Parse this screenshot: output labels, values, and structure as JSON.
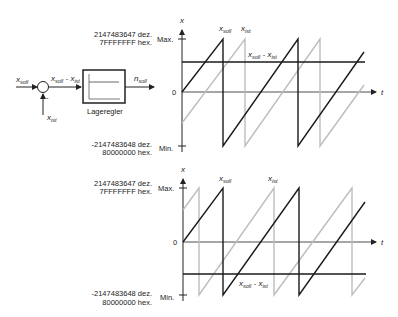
{
  "block_diagram": {
    "input_label": "x",
    "input_sub": "soll",
    "feedback_label": "x",
    "feedback_sub": "ist",
    "minus_sign": "-",
    "error_label_a": "x",
    "error_sub_a": "soll",
    "error_minus": " - ",
    "error_label_b": "x",
    "error_sub_b": "ist",
    "controller_label": "Lageregler",
    "output_label": "n",
    "output_sub": "soll"
  },
  "charts": [
    {
      "id": "top",
      "y_axis_label": "x",
      "x_axis_label": "t",
      "max_label": "Max.",
      "min_label": "Min.",
      "zero_label": "0",
      "max_dec": "2147483647 dez.",
      "max_hex": "7FFFFFFF hex.",
      "min_dec": "-2147483648 dez.",
      "min_hex": "80000000 hex.",
      "series_labels": {
        "soll": {
          "x": "x",
          "sub": "soll"
        },
        "ist": {
          "x": "x",
          "sub": "ist"
        },
        "diff": {
          "a": "x",
          "sub_a": "soll",
          "minus": " - ",
          "b": "x",
          "sub_b": "ist"
        }
      }
    },
    {
      "id": "bottom",
      "y_axis_label": "x",
      "x_axis_label": "t",
      "max_label": "Max.",
      "min_label": "Min.",
      "zero_label": "0",
      "max_dec": "2147483647 dez.",
      "max_hex": "7FFFFFFF hex.",
      "min_dec": "-2147483648 dez.",
      "min_hex": "80000000 hex.",
      "series_labels": {
        "soll": {
          "x": "x",
          "sub": "soll"
        },
        "ist": {
          "x": "x",
          "sub": "ist"
        },
        "diff": {
          "a": "x",
          "sub_a": "soll",
          "minus": " - ",
          "b": "x",
          "sub_b": "ist"
        }
      }
    }
  ],
  "colors": {
    "soll": "#1a1a1a",
    "ist": "#bdbdbd",
    "axis": "#222222"
  }
}
